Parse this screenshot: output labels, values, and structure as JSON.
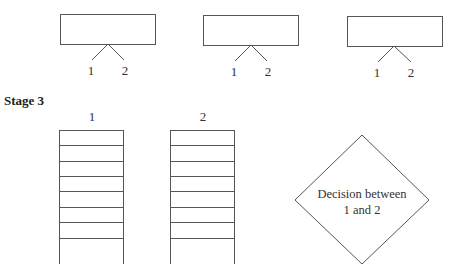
{
  "stage2": {
    "boxes": [
      {
        "left_label": "1",
        "right_label": "2"
      },
      {
        "left_label": "1",
        "right_label": "2"
      },
      {
        "left_label": "1",
        "right_label": "2"
      }
    ]
  },
  "stage3": {
    "title": "Stage 3",
    "columns": [
      {
        "label": "1",
        "rows": 8
      },
      {
        "label": "2",
        "rows": 8
      }
    ],
    "decision": {
      "line1": "Decision between",
      "line2": "1 and 2"
    }
  }
}
